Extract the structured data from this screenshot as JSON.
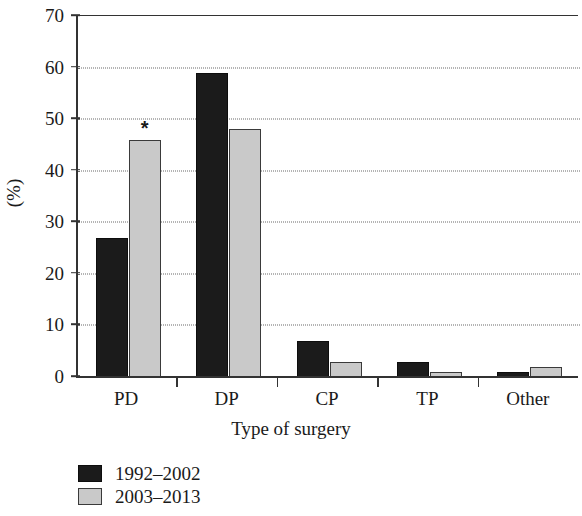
{
  "chart_data": {
    "type": "bar",
    "title": "",
    "xlabel": "Type of surgery",
    "ylabel": "(%)",
    "categories": [
      "PD",
      "DP",
      "CP",
      "TP",
      "Other"
    ],
    "series": [
      {
        "name": "1992–2002",
        "color": "#1b1b1b",
        "values": [
          27,
          59,
          7,
          3,
          1
        ]
      },
      {
        "name": "2003–2013",
        "color": "#c9c9c9",
        "values": [
          46,
          48,
          3,
          1,
          2
        ]
      }
    ],
    "ylim": [
      0,
      70
    ],
    "yticks": [
      0,
      10,
      20,
      30,
      40,
      50,
      60,
      70
    ],
    "ytick_labels": [
      "0",
      "10",
      "20",
      "30",
      "40",
      "50",
      "60",
      "70"
    ],
    "grid": "horizontal-dotted",
    "legend_position": "below-left",
    "annotations": [
      {
        "label": "*",
        "category": "PD",
        "series": "2003–2013",
        "value": 46
      }
    ]
  }
}
